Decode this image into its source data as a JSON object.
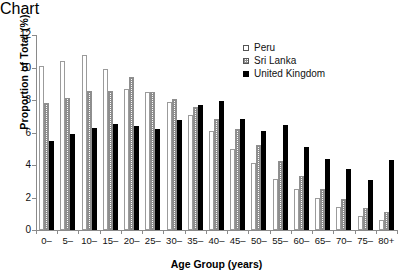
{
  "chart_data": {
    "type": "bar",
    "title": "",
    "xlabel": "Age Group (years)",
    "ylabel": "Proportion of Total (%)",
    "ylim": [
      0,
      12
    ],
    "yticks": [
      0,
      2,
      4,
      6,
      8,
      10,
      12
    ],
    "grid": false,
    "legend_position": "top-right",
    "categories": [
      "0–",
      "5–",
      "10–",
      "15–",
      "20–",
      "25–",
      "30–",
      "35–",
      "40–",
      "45–",
      "50–",
      "55–",
      "60–",
      "65–",
      "70–",
      "75–",
      "80+"
    ],
    "series": [
      {
        "name": "Peru",
        "color": "#ffffff",
        "values": [
          10.1,
          10.4,
          10.8,
          9.9,
          8.65,
          8.5,
          7.9,
          7.05,
          6.1,
          5.0,
          4.1,
          3.15,
          2.5,
          2.0,
          1.4,
          0.85,
          0.6
        ]
      },
      {
        "name": "Sri Lanka",
        "color": "#8d8d8d",
        "values": [
          7.8,
          8.1,
          8.55,
          8.55,
          9.4,
          8.5,
          8.05,
          7.55,
          6.85,
          6.2,
          5.25,
          4.25,
          3.35,
          2.5,
          1.9,
          1.35,
          1.1
        ]
      },
      {
        "name": "United Kingdom",
        "color": "#000000",
        "values": [
          5.45,
          5.9,
          6.3,
          6.5,
          6.4,
          6.2,
          6.75,
          7.7,
          7.95,
          6.85,
          6.1,
          6.45,
          5.1,
          4.4,
          3.75,
          3.05,
          4.3
        ]
      }
    ]
  },
  "legend": {
    "items": [
      {
        "label": "Peru",
        "swatch": "open-square-icon"
      },
      {
        "label": "Sri Lanka",
        "swatch": "hatched-square-icon"
      },
      {
        "label": "United Kingdom",
        "swatch": "filled-square-icon"
      }
    ]
  }
}
